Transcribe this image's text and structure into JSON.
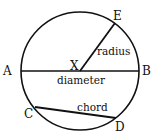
{
  "diagram": {
    "points": {
      "A": "A",
      "B": "B",
      "C": "C",
      "D": "D",
      "E": "E",
      "X": "X"
    },
    "segments": {
      "radius": "radius",
      "diameter": "diameter",
      "chord": "chord"
    },
    "colors": {
      "stroke": "#111111",
      "background": "#ffffff"
    }
  }
}
